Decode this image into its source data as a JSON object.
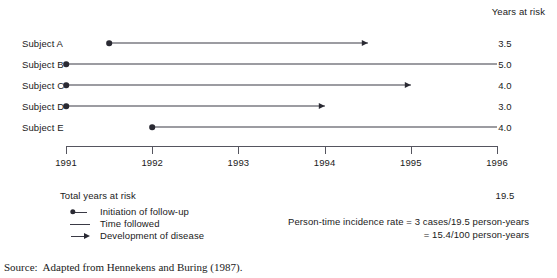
{
  "header": {
    "years_at_risk_label": "Years at risk"
  },
  "chart_data": {
    "type": "timeline",
    "title": "",
    "xlabel": "",
    "ylabel": "",
    "xlim": [
      1991,
      1996
    ],
    "grid": false,
    "legend_position": "bottom-left",
    "tick_labels": [
      "1991",
      "1992",
      "1993",
      "1994",
      "1995",
      "1996"
    ],
    "value_column_header": "Years at risk",
    "categories": [
      "Subject A",
      "Subject B",
      "Subject C",
      "Subject D",
      "Subject E"
    ],
    "values": [
      3.5,
      5.0,
      4.0,
      3.0,
      4.0
    ],
    "subjects": [
      {
        "label": "Subject A",
        "start": 1991.5,
        "end": 1994.5,
        "developed_disease": true,
        "years_at_risk": "3.5"
      },
      {
        "label": "Subject B",
        "start": 1991.0,
        "end": 1996.0,
        "developed_disease": false,
        "years_at_risk": "5.0"
      },
      {
        "label": "Subject C",
        "start": 1991.0,
        "end": 1995.0,
        "developed_disease": true,
        "years_at_risk": "4.0"
      },
      {
        "label": "Subject D",
        "start": 1991.0,
        "end": 1994.0,
        "developed_disease": true,
        "years_at_risk": "3.0"
      },
      {
        "label": "Subject E",
        "start": 1992.0,
        "end": 1996.0,
        "developed_disease": false,
        "years_at_risk": "4.0"
      }
    ],
    "total": {
      "label": "Total years at risk",
      "value": "19.5"
    },
    "annotations": [
      "Person-time incidence rate = 3 cases/19.5 person-years",
      "= 15.4/100 person-years"
    ]
  },
  "legend": {
    "items": [
      {
        "key": "initiation",
        "label": "Initiation of follow-up"
      },
      {
        "key": "time-followed",
        "label": "Time followed"
      },
      {
        "key": "development",
        "label": "Development of disease"
      }
    ]
  },
  "formula": {
    "line1": "Person-time incidence rate = 3 cases/19.5 person-years",
    "line2": "= 15.4/100 person-years"
  },
  "source": {
    "label": "Source:",
    "text": "Adapted from Hennekens and Buring (1987)."
  },
  "colors": {
    "line": "#3a3a45",
    "marker": "#2a2a33",
    "axis": "#55555f",
    "text": "#1a1a1a",
    "background": "#ffffff"
  }
}
